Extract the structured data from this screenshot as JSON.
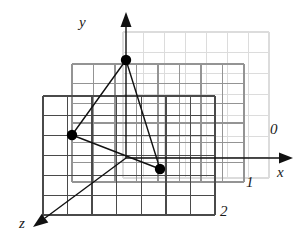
{
  "figure": {
    "background": "#ffffff"
  },
  "axes": {
    "x": {
      "label": "x",
      "label_x": 277,
      "label_y": 177,
      "arrow_tip_x": 293,
      "arrow_tip_y": 158,
      "origin_x": 126,
      "origin_y": 158,
      "color": "#111111"
    },
    "y": {
      "label": "y",
      "label_x": 79,
      "label_y": 27,
      "arrow_tip_x": 126,
      "arrow_tip_y": 12,
      "origin_x": 126,
      "origin_y": 158,
      "color": "#111111"
    },
    "z": {
      "label": "z",
      "label_x": 19,
      "label_y": 228,
      "arrow_tip_x": 33,
      "arrow_tip_y": 227,
      "origin_x": 126,
      "origin_y": 158,
      "color": "#111111"
    }
  },
  "planes": [
    {
      "id": "plane-0",
      "label": "0",
      "label_x": 270,
      "label_y": 134,
      "x": 123,
      "y": 32,
      "w": 146,
      "h": 146,
      "cols": 7,
      "rows": 7,
      "stroke": "#dcdcdc",
      "stroke_width": 1.1
    },
    {
      "id": "plane-1",
      "label": "1",
      "label_x": 246,
      "label_y": 187,
      "x": 72,
      "y": 64,
      "w": 172,
      "h": 118,
      "cols": 8,
      "rows": 6,
      "stroke": "#949494",
      "stroke_width": 1.2
    },
    {
      "id": "plane-2",
      "label": "2",
      "label_x": 220,
      "label_y": 216,
      "x": 43,
      "y": 96,
      "w": 172,
      "h": 119,
      "cols": 7,
      "rows": 6,
      "stroke": "#4a4a4a",
      "stroke_width": 1.3
    }
  ],
  "triangle": {
    "stroke": "#111111",
    "stroke_width": 1.4,
    "fill": "none",
    "vertices": [
      {
        "name": "vertex-top",
        "x": 126,
        "y": 60,
        "r": 5.2,
        "fill": "#000000"
      },
      {
        "name": "vertex-left",
        "x": 72,
        "y": 135,
        "r": 5.2,
        "fill": "#000000"
      },
      {
        "name": "vertex-right",
        "x": 160,
        "y": 169,
        "r": 5.2,
        "fill": "#000000"
      }
    ]
  },
  "icons": {
    "x_axis_arrow": "arrow-right-icon",
    "y_axis_arrow": "arrow-up-icon",
    "z_axis_arrow": "arrow-down-left-icon"
  }
}
